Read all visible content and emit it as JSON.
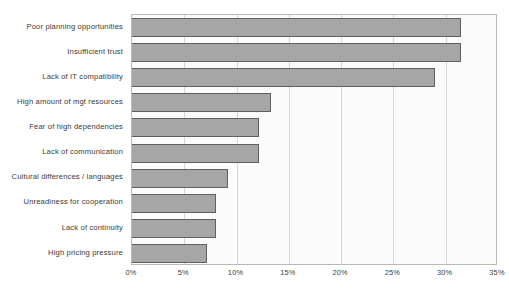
{
  "chart_data": {
    "type": "bar",
    "orientation": "horizontal",
    "title": "",
    "xlabel": "",
    "ylabel": "",
    "categories": [
      "Poor planning opportunities",
      "Insufficient trust",
      "Lack of  IT compatibility",
      "High amount of mgt resources",
      "Fear of high dependencies",
      "Lack of communication",
      "Cultural differences / languages",
      "Unreadiness for cooperation",
      "Lack of continuity",
      "High pricing pressure"
    ],
    "values": [
      31.5,
      31.5,
      29.0,
      13.3,
      12.1,
      12.1,
      9.2,
      8.0,
      8.0,
      7.2
    ],
    "value_unit": "%",
    "xlim": [
      0,
      35
    ],
    "xticks": [
      0,
      5,
      10,
      15,
      20,
      25,
      30,
      35
    ],
    "xtick_labels": [
      "0%",
      "5%",
      "10%",
      "15%",
      "20%",
      "25%",
      "30%",
      "35%"
    ],
    "grid": true,
    "grid_axis": "x",
    "legend": null,
    "colors": {
      "bar_fill": "#a6a6a6",
      "bar_border": "#5f5f5f",
      "plot_background": "#fbfbfb",
      "plot_border": "#b9b9b9",
      "gridline": "#d7d7d7",
      "text": "#3a3a3a",
      "page_background": "#ffffff"
    }
  }
}
